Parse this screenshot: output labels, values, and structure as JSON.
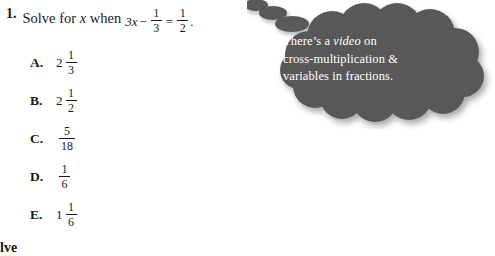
{
  "question": {
    "number": "1.",
    "prompt_before_var": "Solve for ",
    "variable": "x",
    "prompt_after_var": " when",
    "equation": {
      "lhs_coefficient_var": "3x",
      "operator1": "−",
      "fraction1": {
        "numerator": "1",
        "denominator": "3"
      },
      "operator2": "=",
      "fraction2": {
        "numerator": "1",
        "denominator": "2"
      },
      "terminator": "."
    }
  },
  "choices": [
    {
      "letter": "A.",
      "whole": "2",
      "numerator": "1",
      "denominator": "3"
    },
    {
      "letter": "B.",
      "whole": "2",
      "numerator": "1",
      "denominator": "2"
    },
    {
      "letter": "C.",
      "whole": "",
      "numerator": "5",
      "denominator": "18"
    },
    {
      "letter": "D.",
      "whole": "",
      "numerator": "1",
      "denominator": "6"
    },
    {
      "letter": "E.",
      "whole": "1",
      "numerator": "1",
      "denominator": "6"
    }
  ],
  "thought_bubble": {
    "line1_before": "There’s a ",
    "line1_italic": "video",
    "line1_after": " on",
    "line2": "cross-multiplication &",
    "line3": "variables in fractions.",
    "fill_color": "#585858",
    "text_color": "#ffffff"
  },
  "footer": {
    "clipped_word": "olve"
  }
}
